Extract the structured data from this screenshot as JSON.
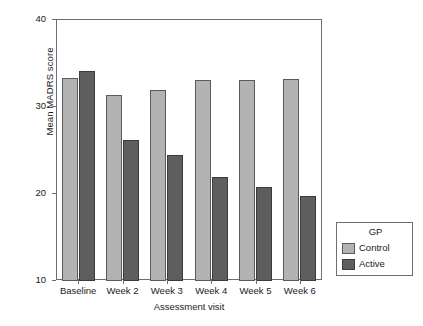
{
  "chart_data": {
    "type": "bar",
    "title": "",
    "subtitle": "",
    "xlabel": "Assessment visit",
    "ylabel": "Mean MADRS score",
    "categories": [
      "Baseline",
      "Week 2",
      "Week 3",
      "Week 4",
      "Week 5",
      "Week 6"
    ],
    "series": [
      {
        "name": "Control",
        "color": "#b3b3b3",
        "values": [
          33.3,
          31.4,
          32.0,
          33.1,
          33.1,
          33.2
        ]
      },
      {
        "name": "Active",
        "color": "#5e5e5e",
        "values": [
          34.1,
          26.2,
          24.5,
          21.9,
          20.8,
          19.8
        ]
      }
    ],
    "ylim": [
      10,
      40
    ],
    "yticks": [
      10,
      20,
      30,
      40
    ],
    "ytick_labels": [
      "10",
      "20",
      "30",
      "40"
    ],
    "grid": false,
    "legend": {
      "title": "GP",
      "position": "right-bottom-outside",
      "entries": [
        "Control",
        "Active"
      ]
    }
  }
}
